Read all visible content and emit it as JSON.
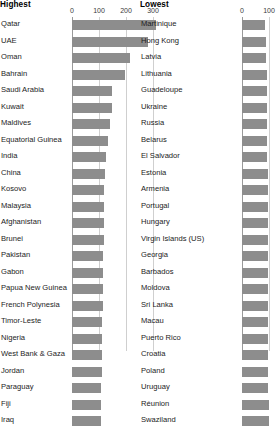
{
  "panels": [
    {
      "id": "highest",
      "title": "Highest",
      "axis": {
        "ticks": [
          0,
          100,
          200,
          300
        ],
        "tick_labels": [
          "0",
          "100",
          "200",
          "300"
        ],
        "min": 0,
        "max": 320
      }
    },
    {
      "id": "lowest",
      "title": "Lowest",
      "axis": {
        "ticks": [
          0,
          100
        ],
        "tick_labels": [
          "0",
          "100"
        ],
        "min": 0,
        "max": 107
      }
    }
  ],
  "colors": {
    "bar": "#8d8d8d",
    "gridline": "#cfcfcf",
    "axis_zero": "#9a9a9a",
    "text": "#1c1c1c",
    "background": "#ffffff"
  },
  "chart_data": [
    {
      "type": "bar",
      "title": "Highest",
      "orientation": "horizontal",
      "xlabel": "",
      "ylabel": "",
      "xlim": [
        0,
        320
      ],
      "grid": true,
      "axis_position": "top",
      "legend": "none",
      "tick_labels": [
        "0",
        "100",
        "200",
        "300"
      ],
      "categories": [
        "Qatar",
        "UAE",
        "Oman",
        "Bahrain",
        "Saudi Arabia",
        "Kuwait",
        "Maldives",
        "Equatorial Guinea",
        "India",
        "China",
        "Kosovo",
        "Malaysia",
        "Afghanistan",
        "Brunei",
        "Pakistan",
        "Gabon",
        "Papua New Guinea",
        "French Polynesia",
        "Timor-Leste",
        "Nigeria",
        "West Bank & Gaza",
        "Jordan",
        "Paraguay",
        "Fiji",
        "Iraq"
      ],
      "values": [
        310,
        280,
        215,
        196,
        148,
        148,
        140,
        134,
        125,
        122,
        120,
        120,
        118,
        117,
        116,
        115,
        114,
        113,
        112,
        112,
        110,
        110,
        109,
        108,
        107
      ]
    },
    {
      "type": "bar",
      "title": "Lowest",
      "orientation": "horizontal",
      "xlabel": "",
      "ylabel": "",
      "xlim": [
        0,
        107
      ],
      "grid": true,
      "axis_position": "top",
      "legend": "none",
      "tick_labels": [
        "0",
        "100"
      ],
      "categories": [
        "Martinique",
        "Hong Kong",
        "Latvia",
        "Lithuania",
        "Guadeloupe",
        "Ukraine",
        "Russia",
        "Belarus",
        "El Salvador",
        "Estonia",
        "Armenia",
        "Portugal",
        "Hungary",
        "Virgin Islands (US)",
        "Georgia",
        "Barbados",
        "Moldova",
        "Sri Lanka",
        "Macau",
        "Puerto Rico",
        "Croatia",
        "Poland",
        "Uruguay",
        "Réunion",
        "Swaziland"
      ],
      "values": [
        85,
        88,
        90,
        91,
        92,
        93,
        93,
        94,
        94,
        95,
        95,
        96,
        96,
        96,
        97,
        97,
        97,
        97,
        97,
        98,
        98,
        98,
        98,
        99,
        99
      ]
    }
  ]
}
